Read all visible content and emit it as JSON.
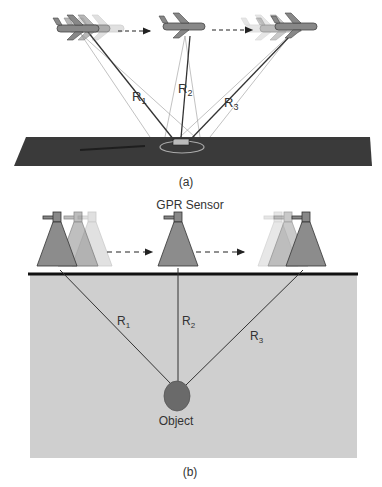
{
  "panel_a": {
    "caption": "(a)",
    "ranges": [
      {
        "label": "R",
        "sub": "1"
      },
      {
        "label": "R",
        "sub": "2"
      },
      {
        "label": "R",
        "sub": "3"
      }
    ],
    "subject": "aircraft-sar"
  },
  "panel_b": {
    "caption": "(b)",
    "sensor_label": "GPR Sensor",
    "object_label": "Object",
    "ranges": [
      {
        "label": "R",
        "sub": "1"
      },
      {
        "label": "R",
        "sub": "2"
      },
      {
        "label": "R",
        "sub": "3"
      }
    ]
  },
  "colors": {
    "ground": "#3a3a3a",
    "soil": "#cfcfcf",
    "sensor": "#8c8c8c",
    "object": "#6a6a6a"
  }
}
